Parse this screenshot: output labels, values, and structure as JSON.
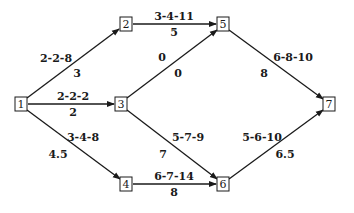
{
  "diagram": {
    "type": "activity-network",
    "nodes": [
      {
        "id": "1",
        "label": "1",
        "x": 21,
        "y": 104
      },
      {
        "id": "2",
        "label": "2",
        "x": 126,
        "y": 24
      },
      {
        "id": "3",
        "label": "3",
        "x": 121,
        "y": 104
      },
      {
        "id": "4",
        "label": "4",
        "x": 126,
        "y": 184
      },
      {
        "id": "5",
        "label": "5",
        "x": 223,
        "y": 24
      },
      {
        "id": "6",
        "label": "6",
        "x": 223,
        "y": 184
      },
      {
        "id": "7",
        "label": "7",
        "x": 329,
        "y": 104
      }
    ],
    "edges": [
      {
        "from": "1",
        "to": "2",
        "estimates": "2-2-8",
        "expected": "3"
      },
      {
        "from": "1",
        "to": "3",
        "estimates": "2-2-2",
        "expected": "2"
      },
      {
        "from": "1",
        "to": "4",
        "estimates": "3-4-8",
        "expected": "4.5"
      },
      {
        "from": "2",
        "to": "5",
        "estimates": "3-4-11",
        "expected": "5"
      },
      {
        "from": "3",
        "to": "5",
        "estimates": "0",
        "expected": "0"
      },
      {
        "from": "3",
        "to": "6",
        "estimates": "5-7-9",
        "expected": "7"
      },
      {
        "from": "4",
        "to": "6",
        "estimates": "6-7-14",
        "expected": "8"
      },
      {
        "from": "5",
        "to": "7",
        "estimates": "6-8-10",
        "expected": "8"
      },
      {
        "from": "6",
        "to": "7",
        "estimates": "5-6-10",
        "expected": "6.5"
      }
    ]
  },
  "colors": {
    "line": "#1a1a1a",
    "background": "#ffffff"
  }
}
